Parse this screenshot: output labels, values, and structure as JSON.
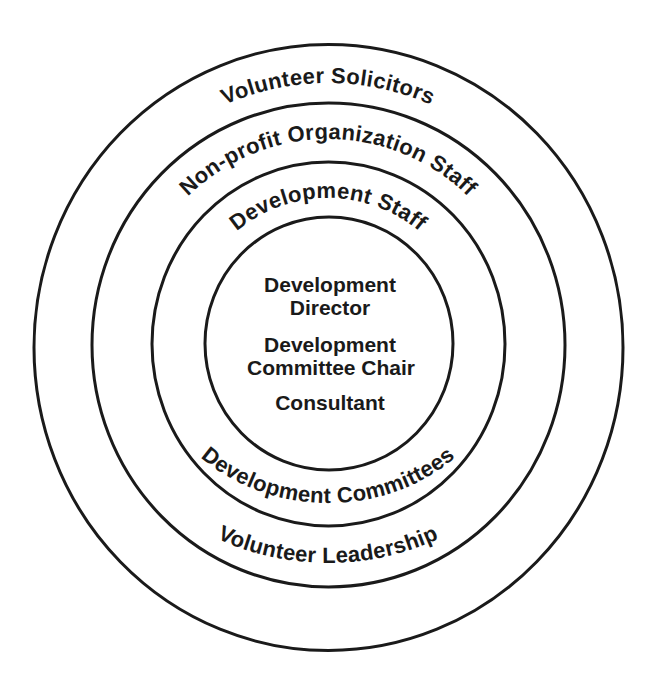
{
  "diagram": {
    "type": "concentric-circles",
    "colors": {
      "stroke": "#1a1a1a",
      "text": "#1a1a1a",
      "background": "#ffffff"
    },
    "rings": [
      {
        "id": "outer",
        "top_label": "Volunteer Solicitors",
        "bottom_label": "Volunteer Leadership"
      },
      {
        "id": "second",
        "top_label": "Non-profit Organization Staff",
        "bottom_label": "Development Committees"
      },
      {
        "id": "third",
        "top_label": "Development Staff",
        "bottom_label": ""
      }
    ],
    "core": {
      "lines": [
        "Development",
        "Director",
        "Development",
        "Committee Chair",
        "Consultant"
      ]
    }
  }
}
